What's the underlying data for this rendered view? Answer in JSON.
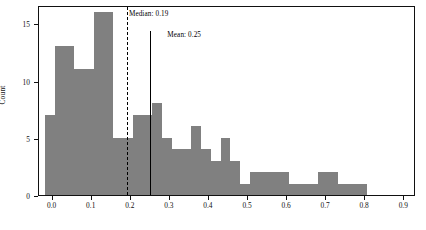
{
  "chart_data": {
    "type": "bar",
    "title": "",
    "xlabel": "",
    "ylabel": "Count",
    "xlim": [
      -0.035,
      0.93
    ],
    "ylim": [
      0,
      16.6
    ],
    "grid": false,
    "legend": null,
    "bin_width": 0.025,
    "bar_color": "#808080",
    "xticks": [
      0.0,
      0.1,
      0.2,
      0.3,
      0.4,
      0.5,
      0.6,
      0.7,
      0.8,
      0.9
    ],
    "xticklabels": [
      "0.0",
      "0.1",
      "0.2",
      "0.3",
      "0.4",
      "0.5",
      "0.6",
      "0.7",
      "0.8",
      "0.9"
    ],
    "yticks": [
      0,
      5,
      10,
      15
    ],
    "yticklabels": [
      "0",
      "5",
      "10",
      "15"
    ],
    "bin_edges": [
      -0.02,
      0.005,
      0.03,
      0.055,
      0.08,
      0.105,
      0.13,
      0.155,
      0.18,
      0.205,
      0.23,
      0.255,
      0.28,
      0.305,
      0.33,
      0.355,
      0.38,
      0.405,
      0.43,
      0.455,
      0.48,
      0.505,
      0.53,
      0.555,
      0.58,
      0.605,
      0.63,
      0.655,
      0.68,
      0.705,
      0.73,
      0.755,
      0.78,
      0.805,
      0.83,
      0.855,
      0.88,
      0.905
    ],
    "values": [
      7,
      13,
      13,
      11,
      11,
      16,
      16,
      5,
      5,
      7,
      7,
      8,
      5,
      4,
      4,
      6,
      4,
      3,
      5,
      3,
      1,
      2,
      2,
      2,
      2,
      1,
      1,
      1,
      2,
      2,
      1,
      1,
      1
    ],
    "annotations": [
      {
        "name": "median",
        "label": "Median: 0.19",
        "value": 0.19,
        "linestyle": "dashed"
      },
      {
        "name": "mean",
        "label": "Mean: 0.25",
        "value": 0.25,
        "linestyle": "solid"
      }
    ]
  }
}
